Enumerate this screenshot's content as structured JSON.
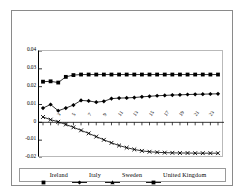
{
  "chart_data": {
    "type": "line",
    "title": "",
    "xlabel": "",
    "ylabel": "",
    "ylim": [
      -0.02,
      0.04
    ],
    "yticks": [
      "0.04",
      "0.03",
      "0.02",
      "0.01",
      "0",
      "-0.01",
      "-0.02"
    ],
    "ytick_values": [
      0.04,
      0.03,
      0.02,
      0.01,
      0,
      -0.01,
      -0.02
    ],
    "x": [
      1,
      2,
      3,
      4,
      5,
      6,
      7,
      8,
      9,
      10,
      11,
      12,
      13,
      14,
      15,
      16,
      17,
      18,
      19,
      20,
      21,
      22,
      23,
      24
    ],
    "xticks": [
      "3",
      "5",
      "7",
      "9",
      "11",
      "13",
      "15",
      "17",
      "19",
      "21",
      "23"
    ],
    "xtick_values": [
      3,
      5,
      7,
      9,
      11,
      13,
      15,
      17,
      19,
      21,
      23
    ],
    "grid": false,
    "legend_position": "bottom",
    "series": [
      {
        "name": "Ireland",
        "marker": "square",
        "values": [
          0.0228,
          0.023,
          0.0223,
          0.0255,
          0.0265,
          0.0268,
          0.0268,
          0.0268,
          0.0268,
          0.0268,
          0.0268,
          0.0268,
          0.0268,
          0.0268,
          0.0268,
          0.0268,
          0.0268,
          0.0268,
          0.0268,
          0.0268,
          0.0268,
          0.0268,
          0.0268,
          0.0268
        ]
      },
      {
        "name": "Italy",
        "marker": "diamond",
        "values": [
          0.008,
          0.01,
          0.0065,
          0.008,
          0.0097,
          0.0123,
          0.012,
          0.0113,
          0.0118,
          0.0133,
          0.0136,
          0.0137,
          0.0139,
          0.0143,
          0.0146,
          0.0149,
          0.0151,
          0.0153,
          0.0154,
          0.0156,
          0.0157,
          0.0158,
          0.0159,
          0.016
        ]
      },
      {
        "name": "Sweden",
        "marker": "triangle",
        "values": [
          0.0,
          0.0,
          0.0,
          0.0,
          0.0,
          0.0,
          0.0,
          0.0,
          0.0,
          0.0,
          0.0,
          0.0,
          0.0,
          0.0,
          0.0,
          0.0,
          0.0,
          0.0,
          0.0,
          0.0,
          0.0,
          0.0,
          0.0,
          0.0
        ]
      },
      {
        "name": "United Kingdom",
        "marker": "cross",
        "values": [
          0.003,
          0.0015,
          0.0003,
          -0.0012,
          -0.0028,
          -0.0045,
          -0.0062,
          -0.008,
          -0.0098,
          -0.0115,
          -0.013,
          -0.0142,
          -0.0152,
          -0.016,
          -0.0165,
          -0.0168,
          -0.017,
          -0.0171,
          -0.0172,
          -0.0172,
          -0.0173,
          -0.0173,
          -0.0173,
          -0.0173
        ]
      }
    ]
  },
  "legend": {
    "items": [
      {
        "label": "Ireland",
        "marker": "square"
      },
      {
        "label": "Italy",
        "marker": "diamond"
      },
      {
        "label": "Sweden",
        "marker": "triangle"
      },
      {
        "label": "United Kingdom",
        "marker": "cross"
      }
    ]
  },
  "colors": {
    "series": "#000000",
    "frame": "#8a8a8a",
    "plot_border": "#b9b9b9",
    "axis": "#000000",
    "background": "#ffffff"
  }
}
